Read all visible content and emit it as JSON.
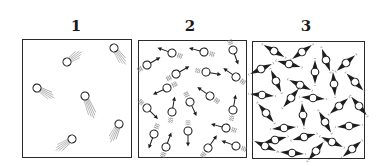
{
  "diagram": {
    "panels": [
      {
        "label": "1",
        "label_x": 76,
        "box": {
          "x": 22,
          "y": 39,
          "w": 110,
          "h": 119
        },
        "style": "trail",
        "particles": [
          {
            "x": 67,
            "y": 62,
            "a": -35,
            "len": 18
          },
          {
            "x": 114,
            "y": 48,
            "a": 55,
            "len": 20
          },
          {
            "x": 37,
            "y": 88,
            "a": 30,
            "len": 20
          },
          {
            "x": 85,
            "y": 96,
            "a": 68,
            "len": 24
          },
          {
            "x": 119,
            "y": 124,
            "a": 115,
            "len": 20
          },
          {
            "x": 72,
            "y": 139,
            "a": 145,
            "len": 20
          }
        ]
      },
      {
        "label": "2",
        "label_x": 190,
        "box": {
          "x": 138,
          "y": 40,
          "w": 109,
          "h": 118
        },
        "style": "arrow",
        "particles": [
          {
            "x": 172,
            "y": 53,
            "a": 200
          },
          {
            "x": 204,
            "y": 52,
            "a": 195
          },
          {
            "x": 233,
            "y": 50,
            "a": 70
          },
          {
            "x": 147,
            "y": 65,
            "a": -30
          },
          {
            "x": 176,
            "y": 74,
            "a": -30
          },
          {
            "x": 206,
            "y": 72,
            "a": 10
          },
          {
            "x": 236,
            "y": 77,
            "a": 215
          },
          {
            "x": 167,
            "y": 88,
            "a": 155
          },
          {
            "x": 210,
            "y": 96,
            "a": 215
          },
          {
            "x": 147,
            "y": 108,
            "a": 45
          },
          {
            "x": 172,
            "y": 112,
            "a": -80
          },
          {
            "x": 190,
            "y": 102,
            "a": 65
          },
          {
            "x": 233,
            "y": 110,
            "a": -80
          },
          {
            "x": 154,
            "y": 134,
            "a": 110
          },
          {
            "x": 166,
            "y": 147,
            "a": -70
          },
          {
            "x": 188,
            "y": 131,
            "a": 90
          },
          {
            "x": 208,
            "y": 148,
            "a": -55
          },
          {
            "x": 226,
            "y": 128,
            "a": 195
          },
          {
            "x": 236,
            "y": 146,
            "a": 200
          }
        ]
      },
      {
        "label": "3",
        "label_x": 306,
        "box": {
          "x": 252,
          "y": 41,
          "w": 113,
          "h": 118
        },
        "style": "spindle",
        "particles": [
          {
            "x": 274,
            "y": 51,
            "a": 30
          },
          {
            "x": 302,
            "y": 52,
            "a": -35
          },
          {
            "x": 326,
            "y": 60,
            "a": 70
          },
          {
            "x": 346,
            "y": 63,
            "a": -40
          },
          {
            "x": 261,
            "y": 69,
            "a": -25
          },
          {
            "x": 289,
            "y": 64,
            "a": 15
          },
          {
            "x": 315,
            "y": 72,
            "a": 90
          },
          {
            "x": 276,
            "y": 81,
            "a": 65
          },
          {
            "x": 300,
            "y": 85,
            "a": 25
          },
          {
            "x": 334,
            "y": 84,
            "a": 85
          },
          {
            "x": 355,
            "y": 82,
            "a": 45
          },
          {
            "x": 262,
            "y": 95,
            "a": 5
          },
          {
            "x": 291,
            "y": 98,
            "a": -50
          },
          {
            "x": 313,
            "y": 98,
            "a": 5
          },
          {
            "x": 339,
            "y": 106,
            "a": -40
          },
          {
            "x": 359,
            "y": 106,
            "a": 50
          },
          {
            "x": 266,
            "y": 113,
            "a": 50
          },
          {
            "x": 303,
            "y": 115,
            "a": 85
          },
          {
            "x": 325,
            "y": 122,
            "a": 60
          },
          {
            "x": 284,
            "y": 128,
            "a": -5
          },
          {
            "x": 275,
            "y": 140,
            "a": -15
          },
          {
            "x": 349,
            "y": 126,
            "a": -5
          },
          {
            "x": 304,
            "y": 137,
            "a": -15
          },
          {
            "x": 332,
            "y": 142,
            "a": 25
          },
          {
            "x": 265,
            "y": 146,
            "a": 25
          },
          {
            "x": 292,
            "y": 153,
            "a": 5
          },
          {
            "x": 316,
            "y": 151,
            "a": -50
          },
          {
            "x": 352,
            "y": 149,
            "a": -40
          }
        ]
      }
    ],
    "colors": {
      "ink": "#1e1e1e",
      "trail": "#8a8a8a",
      "frame": "#2a2a2a",
      "background": "#ffffff"
    }
  }
}
